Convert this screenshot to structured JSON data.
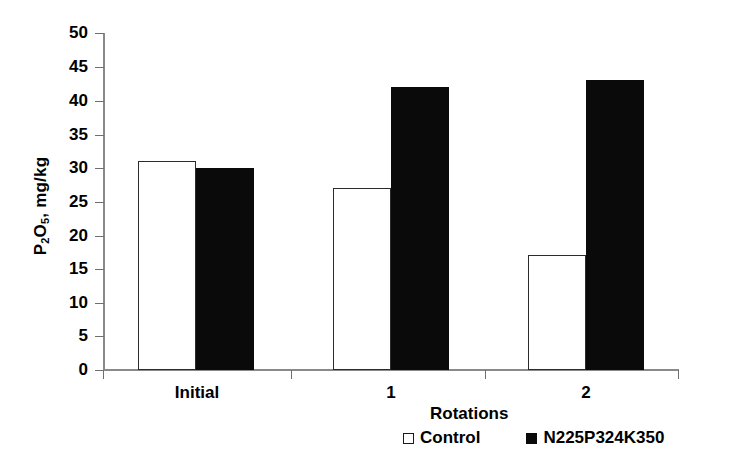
{
  "chart_data": {
    "type": "bar",
    "title": "",
    "subtitle": "",
    "xlabel": "Rotations",
    "ylabel": "P2O5, mg/kg",
    "ylabel_parts": {
      "pre": "P",
      "sub1": "2",
      "mid": "O",
      "sub2": "5",
      "post": ", mg/kg"
    },
    "categories": [
      "Initial",
      "1",
      "2"
    ],
    "series": [
      {
        "name": "Control",
        "values": [
          31,
          27,
          17
        ],
        "color": "#ffffff",
        "edge_color": "#2b2b2b",
        "swatch": "hollow-square"
      },
      {
        "name": "N225P324K350",
        "values": [
          30,
          42,
          43
        ],
        "color": "#0a0a0a",
        "edge_color": "#0a0a0a",
        "swatch": "filled-square"
      }
    ],
    "ylim": [
      0,
      50
    ],
    "ytick_values": [
      0,
      5,
      10,
      15,
      20,
      25,
      30,
      35,
      40,
      45,
      50
    ],
    "ytick_labels": [
      "0",
      "5",
      "10",
      "15",
      "20",
      "25",
      "30",
      "35",
      "40",
      "45",
      "50"
    ],
    "grid": false,
    "legend_position": "bottom",
    "legend_entries": [
      "Control",
      "N225P324K350"
    ]
  },
  "axes": {
    "y_title": "P2O5, mg/kg",
    "x_title": "Rotations"
  },
  "colors": {
    "background": "#ffffff",
    "axis": "#8a8a8a",
    "text": "#000000",
    "series_control": "#ffffff",
    "series_treatment": "#0a0a0a"
  }
}
